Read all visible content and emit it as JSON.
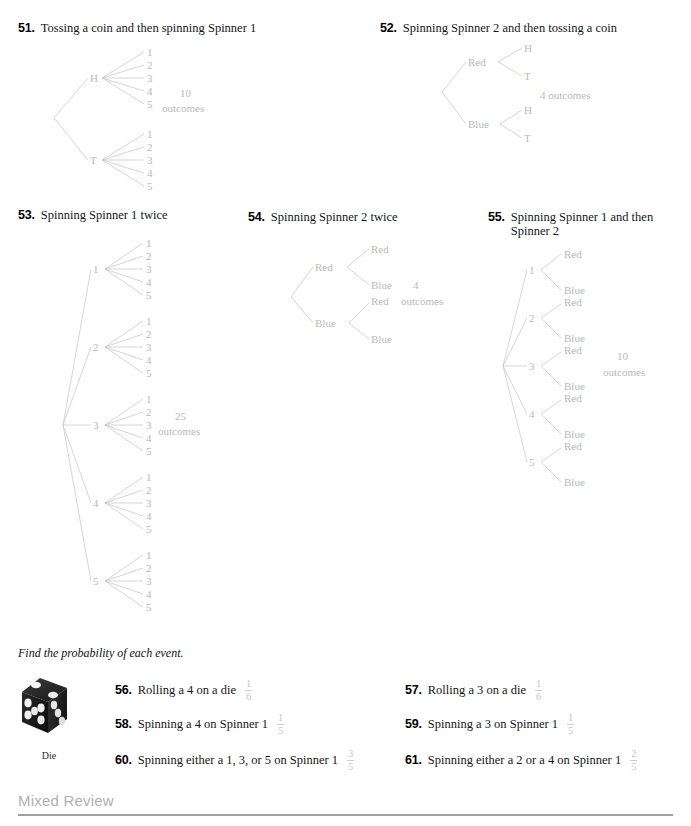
{
  "page": {
    "width": 691,
    "height": 826,
    "background": "#ffffff",
    "tree_line_color": "#c3c3c3",
    "tree_label_color": "#b9b9b9",
    "answer_color": "#c6c6c6"
  },
  "problems": [
    {
      "number": "51.",
      "text": "Tossing a coin and then spinning Spinner 1",
      "outcomes_count": "10",
      "outcomes_word": "outcomes",
      "level1": [
        "H",
        "T"
      ],
      "level2": [
        "1",
        "2",
        "3",
        "4",
        "5"
      ]
    },
    {
      "number": "52.",
      "text": "Spinning Spinner 2 and then tossing a coin",
      "outcomes_count": "4",
      "outcomes_word": "outcomes",
      "outcomes_label": "4 outcomes",
      "level1": [
        "Red",
        "Blue"
      ],
      "level2": [
        "H",
        "T"
      ]
    },
    {
      "number": "53.",
      "text": "Spinning Spinner 1 twice",
      "outcomes_count": "25",
      "outcomes_word": "outcomes",
      "level1": [
        "1",
        "2",
        "3",
        "4",
        "5"
      ],
      "level2": [
        "1",
        "2",
        "3",
        "4",
        "5"
      ]
    },
    {
      "number": "54.",
      "text": "Spinning Spinner 2 twice",
      "outcomes_count": "4",
      "outcomes_word": "outcomes",
      "level1": [
        "Red",
        "Blue"
      ],
      "level2": [
        "Red",
        "Blue"
      ]
    },
    {
      "number": "55.",
      "text": "Spinning Spinner 1 and then Spinner 2",
      "outcomes_count": "10",
      "outcomes_word": "outcomes",
      "level1": [
        "1",
        "2",
        "3",
        "4",
        "5"
      ],
      "level2": [
        "Red",
        "Blue"
      ]
    }
  ],
  "probability_section": {
    "instruction": "Find the probability of each event.",
    "die_caption": "Die",
    "exercises": [
      {
        "number": "56.",
        "text": "Rolling a 4 on a die",
        "numerator": "1",
        "denominator": "6"
      },
      {
        "number": "57.",
        "text": "Rolling a 3 on a die",
        "numerator": "1",
        "denominator": "6"
      },
      {
        "number": "58.",
        "text": "Spinning a 4 on Spinner 1",
        "numerator": "1",
        "denominator": "5"
      },
      {
        "number": "59.",
        "text": "Spinning a 3 on Spinner 1",
        "numerator": "1",
        "denominator": "5"
      },
      {
        "number": "60.",
        "text": "Spinning either a 1, 3, or 5 on Spinner 1",
        "numerator": "3",
        "denominator": "5"
      },
      {
        "number": "61.",
        "text": "Spinning either a 2 or a 4 on Spinner 1",
        "numerator": "2",
        "denominator": "5"
      }
    ]
  },
  "footer": {
    "title": "Mixed Review"
  }
}
